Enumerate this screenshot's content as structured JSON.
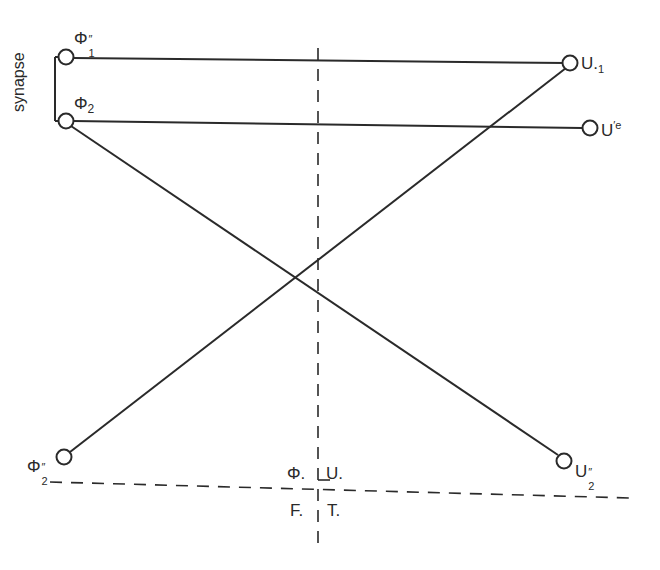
{
  "diagram": {
    "synapse_label": "synapse",
    "nodes": {
      "phi1": {
        "base": "Φ",
        "sub": "1",
        "sup": "″"
      },
      "phi2": {
        "base": "Φ",
        "sub": "2",
        "sup": ""
      },
      "phi2b": {
        "base": "Φ",
        "sub": "2",
        "sup": "″"
      },
      "u1": {
        "base": "U.",
        "sub": "1",
        "sup": ""
      },
      "ue": {
        "base": "U",
        "sub": "",
        "sup": "′e"
      },
      "u2": {
        "base": "U",
        "sub": "2",
        "sup": "″"
      }
    },
    "quadrants": {
      "top_left": "Φ.",
      "top_right": "U.",
      "bottom_left": "F.",
      "bottom_right": "T."
    },
    "connections": [
      {
        "from": "Φ1″",
        "to": "U.1"
      },
      {
        "from": "Φ2",
        "to": "U′e"
      },
      {
        "from": "Φ2",
        "to": "U2″"
      },
      {
        "from": "Φ2″",
        "to": "U.1"
      }
    ],
    "colors": {
      "stroke": "#2a2a2a",
      "background": "#ffffff"
    }
  }
}
